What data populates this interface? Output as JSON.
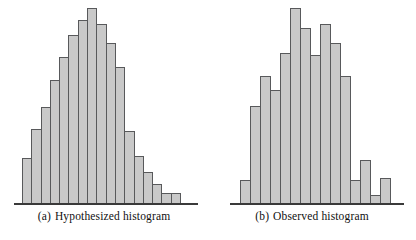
{
  "figure": {
    "background_color": "#ffffff",
    "bar_fill_color": "#c9c9c9",
    "bar_border_color": "#58595b",
    "axis_color": "#3a3a3a"
  },
  "panels": [
    {
      "id": "a",
      "tag": "(a)",
      "caption": "Hypothesized histogram",
      "caption_full": "(a)  Hypothesized histogram"
    },
    {
      "id": "b",
      "tag": "(b)",
      "caption": "Observed histogram",
      "caption_full": "(b)  Observed histogram"
    }
  ],
  "chart_data": [
    {
      "type": "bar",
      "title": "(a)  Hypothesized histogram",
      "xlabel": "",
      "ylabel": "",
      "grid": false,
      "legend": "none",
      "axis": "x-axis only (baseline), no tick labels, no y-axis",
      "ylim": [
        0,
        1
      ],
      "bar_count": 17,
      "categories": [
        "1",
        "2",
        "3",
        "4",
        "5",
        "6",
        "7",
        "8",
        "9",
        "10",
        "11",
        "12",
        "13",
        "14",
        "15",
        "16",
        "17"
      ],
      "values": [
        0.23,
        0.38,
        0.49,
        0.63,
        0.75,
        0.86,
        0.94,
        1.0,
        0.92,
        0.82,
        0.7,
        0.37,
        0.24,
        0.16,
        0.1,
        0.05,
        0.05
      ],
      "bar_width_px": 10.3,
      "note": "Smooth unimodal bell-shaped distribution peaking at bin 8 with a right tail"
    },
    {
      "type": "bar",
      "title": "(b)  Observed histogram",
      "xlabel": "",
      "ylabel": "",
      "grid": false,
      "legend": "none",
      "axis": "x-axis only (baseline), no tick labels, no y-axis",
      "ylim": [
        0,
        1
      ],
      "bar_count": 15,
      "categories": [
        "1",
        "2",
        "3",
        "4",
        "5",
        "6",
        "7",
        "8",
        "9",
        "10",
        "11",
        "12",
        "13",
        "14",
        "15"
      ],
      "values": [
        0.12,
        0.5,
        0.65,
        0.58,
        0.77,
        1.0,
        0.9,
        0.76,
        0.92,
        0.82,
        0.65,
        0.12,
        0.22,
        0.04,
        0.13
      ],
      "bar_width_px": 11.0,
      "note": "Irregular jagged distribution peaking at bin 6 with sampling noise"
    }
  ]
}
